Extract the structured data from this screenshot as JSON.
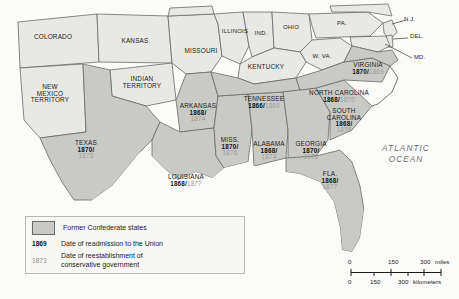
{
  "figure": {
    "kind": "historical-thematic-map"
  },
  "colors": {
    "confederate_fill": "#c9c9c6",
    "union_fill": "#e8e8e5",
    "ocean_fill": "#fbfbfa",
    "border": "#6a6a68",
    "page_background": "#eeeeec",
    "date_bold": "#111111",
    "date_grey": "#9a9a97",
    "ocean_text": "#6f6f6d"
  },
  "ocean_label": {
    "line1": "ATLANTIC",
    "line2": "OCEAN"
  },
  "country_label": "MEXICO",
  "legend": {
    "swatch_label": "Former Confederate states",
    "rows": [
      {
        "key": "1869",
        "style": "bold",
        "text": "Date of readmission to the Union"
      },
      {
        "key": "1873",
        "style": "grey",
        "text_line1": "Date of reestablishment of",
        "text_line2": "conservative government"
      }
    ]
  },
  "scalebar": {
    "miles": {
      "ticks": [
        "0",
        "150",
        "300"
      ],
      "unit": "miles"
    },
    "kilometers": {
      "ticks": [
        "0",
        "150",
        "300"
      ],
      "unit": "kilometers"
    }
  },
  "confederate_states": [
    {
      "id": "texas",
      "name": "TEXAS",
      "name2": "",
      "readmission": "1870/",
      "conservative": "1873"
    },
    {
      "id": "arkansas",
      "name": "ARKANSAS",
      "name2": "",
      "readmission": "1868/",
      "conservative": "1874"
    },
    {
      "id": "louisiana",
      "name": "LOUISIANA",
      "name2": "",
      "readmission": "1868/",
      "conservative": "1877",
      "inline": true
    },
    {
      "id": "mississippi",
      "name": "MISS.",
      "name2": "",
      "readmission": "1870/",
      "conservative": "1876"
    },
    {
      "id": "alabama",
      "name": "ALABAMA",
      "name2": "",
      "readmission": "1868/",
      "conservative": "1874"
    },
    {
      "id": "georgia",
      "name": "GEORGIA",
      "name2": "",
      "readmission": "1870/",
      "conservative": "1871"
    },
    {
      "id": "florida",
      "name": "FLA.",
      "name2": "",
      "readmission": "1868/",
      "conservative": "1877"
    },
    {
      "id": "tennessee",
      "name": "TENNESSEE",
      "name2": "",
      "readmission": "1866/",
      "conservative": "1869",
      "inline": true
    },
    {
      "id": "south-carolina",
      "name": "SOUTH",
      "name2": "CAROLINA",
      "readmission": "1868/",
      "conservative": "1876"
    },
    {
      "id": "north-carolina",
      "name": "NORTH CAROLINA",
      "name2": "",
      "readmission": "1868/",
      "conservative": "1870",
      "inline": true
    },
    {
      "id": "virginia",
      "name": "VIRGINIA",
      "name2": "",
      "readmission": "1870/",
      "conservative": "1869",
      "inline": true
    }
  ],
  "other_places": [
    {
      "id": "colorado",
      "name": "COLORADO",
      "name2": "",
      "name3": ""
    },
    {
      "id": "kansas",
      "name": "KANSAS",
      "name2": "",
      "name3": ""
    },
    {
      "id": "missouri",
      "name": "MISSOURI",
      "name2": "",
      "name3": ""
    },
    {
      "id": "illinois",
      "name": "ILLINOIS",
      "name2": "",
      "name3": ""
    },
    {
      "id": "indiana",
      "name": "IND.",
      "name2": "",
      "name3": ""
    },
    {
      "id": "ohio",
      "name": "OHIO",
      "name2": "",
      "name3": ""
    },
    {
      "id": "pennsylvania",
      "name": "PA.",
      "name2": "",
      "name3": ""
    },
    {
      "id": "new-jersey",
      "name": "N.J.",
      "name2": "",
      "name3": ""
    },
    {
      "id": "delaware",
      "name": "DEL.",
      "name2": "",
      "name3": ""
    },
    {
      "id": "maryland",
      "name": "MD.",
      "name2": "",
      "name3": ""
    },
    {
      "id": "west-virginia",
      "name": "W. VA.",
      "name2": "",
      "name3": ""
    },
    {
      "id": "kentucky",
      "name": "KENTUCKY",
      "name2": "",
      "name3": ""
    },
    {
      "id": "new-mexico",
      "name": "NEW",
      "name2": "MEXICO",
      "name3": "TERRITORY"
    },
    {
      "id": "indian-territory",
      "name": "INDIAN",
      "name2": "TERRITORY",
      "name3": ""
    }
  ]
}
